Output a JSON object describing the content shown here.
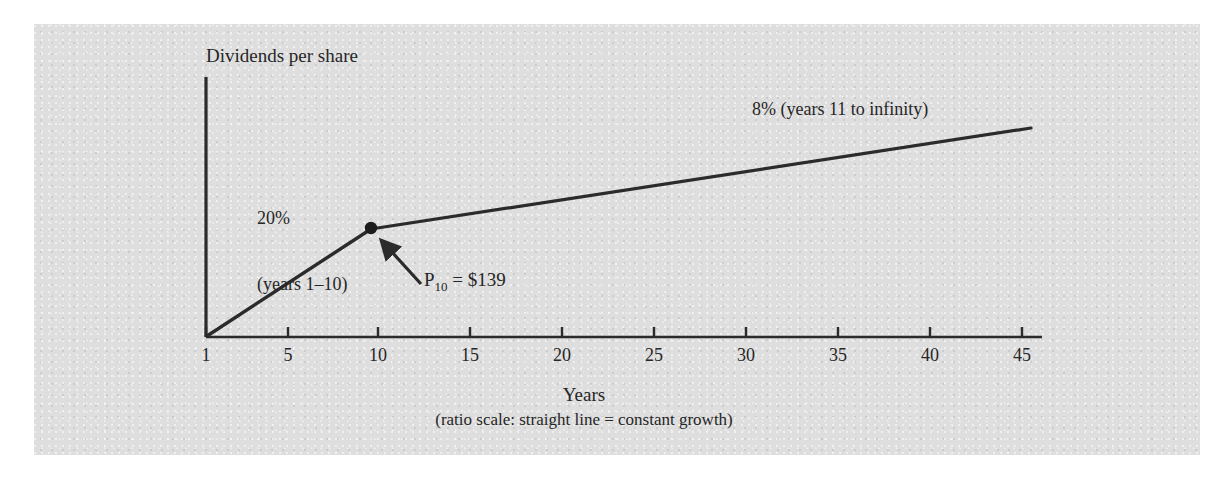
{
  "figure": {
    "background_color": "#ffffff",
    "panel_color": "#dedede",
    "ink_color": "#2b2b2b"
  },
  "axes": {
    "y_title": "Dividends per share",
    "x_title": "Years",
    "x_caption": "(ratio scale: straight line = constant growth)",
    "x_ticks": [
      "1",
      "5",
      "10",
      "15",
      "20",
      "25",
      "30",
      "35",
      "40",
      "45"
    ]
  },
  "annotations": {
    "growth_phase_1_line1": "20%",
    "growth_phase_1_line2": "(years 1–10)",
    "growth_phase_2": "8% (years 11 to infinity)",
    "price_label_base": "P",
    "price_label_sub": "10",
    "price_label_value": " = $139"
  },
  "chart_data": {
    "type": "line",
    "title": "",
    "subtitle": "",
    "xlabel": "Years",
    "ylabel": "Dividends per share",
    "x_scale": "ratio (log)",
    "xlim": [
      1,
      48
    ],
    "x_ticks": [
      1,
      5,
      10,
      15,
      20,
      25,
      30,
      35,
      40,
      45
    ],
    "y_ticks": [],
    "grid": false,
    "legend": "none",
    "series": [
      {
        "name": "20% (years 1–10)",
        "growth_rate_percent": 20,
        "x": [
          1,
          10
        ],
        "y_relative": [
          0,
          1.0
        ],
        "style": "straight segment on ratio scale"
      },
      {
        "name": "8% (years 11 to infinity)",
        "growth_rate_percent": 8,
        "x": [
          10,
          48
        ],
        "y_relative": [
          1.0,
          1.92
        ],
        "style": "straight segment on ratio scale"
      }
    ],
    "markers": [
      {
        "name": "P10",
        "x": 10,
        "label": "P10 = $139",
        "value": 139,
        "currency": "$",
        "shape": "filled-circle",
        "callout": "arrow pointing up-left to marker"
      }
    ],
    "notes": "(ratio scale: straight line = constant growth)"
  }
}
